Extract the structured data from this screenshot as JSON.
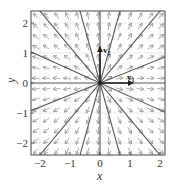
{
  "chart_data": {
    "type": "vector-field",
    "title": "",
    "xlabel": "x",
    "ylabel": "y",
    "xlim": [
      -2.3,
      2.2
    ],
    "ylim": [
      -2.4,
      2.4
    ],
    "xticks": [
      "-2",
      "-1",
      "0",
      "1",
      "2"
    ],
    "yticks": [
      "-2",
      "-1",
      "0",
      "1",
      "2"
    ],
    "grid": true,
    "field_description": "radial field pointing away from origin (star node / proper node, unstable)",
    "eigenvectors": [
      {
        "name": "v1",
        "label": "v",
        "subscript": "1",
        "direction": [
          1,
          0
        ],
        "length": 1.1
      },
      {
        "name": "v2",
        "label": "v",
        "subscript": "2",
        "direction": [
          0,
          1
        ],
        "length": 1.2
      }
    ],
    "trajectory_slopes": [
      0,
      "vertical",
      0.4,
      -0.45,
      1.2,
      -1.2,
      3.6,
      -3.6
    ],
    "arrow_color": "#888888",
    "line_color": "#555555",
    "axis_color": "#333333"
  }
}
